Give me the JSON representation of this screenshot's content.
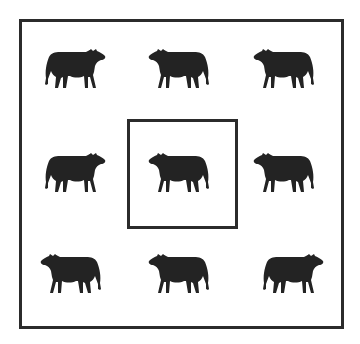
{
  "figure": {
    "colors": {
      "ink": "#232323",
      "frame": "#2b2b2b",
      "background": "#ffffff"
    },
    "cows": [
      {
        "row": 1,
        "col": 1,
        "facing": "right",
        "x": 42,
        "y": 48
      },
      {
        "row": 1,
        "col": 2,
        "facing": "left",
        "x": 148,
        "y": 48
      },
      {
        "row": 1,
        "col": 3,
        "facing": "left",
        "x": 253,
        "y": 48
      },
      {
        "row": 2,
        "col": 1,
        "facing": "right",
        "x": 42,
        "y": 152
      },
      {
        "row": 2,
        "col": 2,
        "facing": "left",
        "x": 148,
        "y": 152
      },
      {
        "row": 2,
        "col": 3,
        "facing": "left",
        "x": 253,
        "y": 152
      },
      {
        "row": 3,
        "col": 1,
        "facing": "left",
        "x": 40,
        "y": 253
      },
      {
        "row": 3,
        "col": 2,
        "facing": "left",
        "x": 148,
        "y": 253
      },
      {
        "row": 3,
        "col": 3,
        "facing": "right",
        "x": 260,
        "y": 253
      }
    ],
    "highlighted_cell": {
      "row": 2,
      "col": 2
    }
  }
}
